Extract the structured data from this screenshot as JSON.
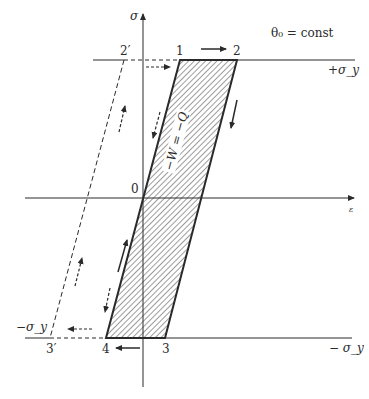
{
  "diagram": {
    "title_annotation": "θ₀ = const",
    "axes": {
      "y_label": "σ",
      "x_label": "ε"
    },
    "levels": {
      "upper": "+σ_y",
      "lower_right": "− σ_y",
      "lower_left": "−σ_y"
    },
    "points": {
      "origin": "0",
      "p1": "1",
      "p2": "2",
      "p3": "3",
      "p4": "4",
      "p2prime": "2′",
      "p3prime": "3′"
    },
    "region_label": "−W = −Q",
    "colors": {
      "line": "#2a2a2a",
      "hatch": "#3a3a3a",
      "background": "#ffffff"
    }
  }
}
